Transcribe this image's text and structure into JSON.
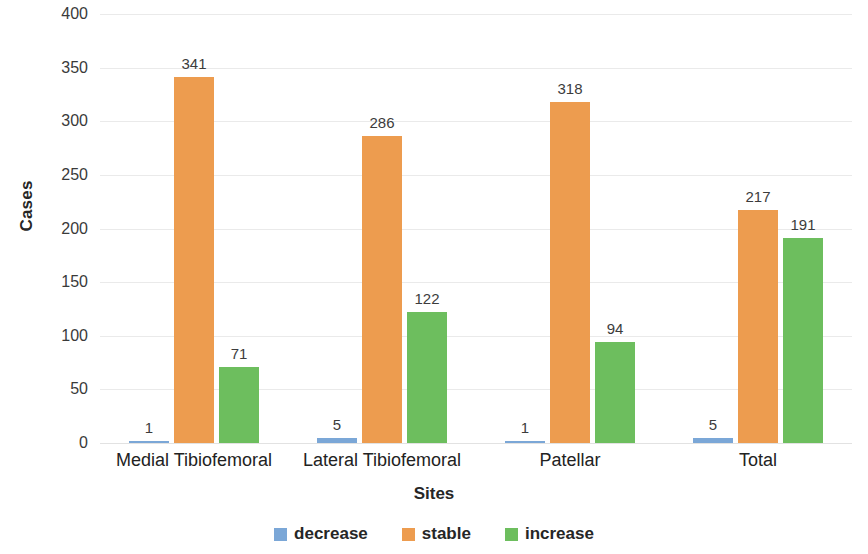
{
  "chart_data": {
    "type": "bar",
    "title": "",
    "xlabel": "Sites",
    "ylabel": "Cases",
    "categories": [
      "Medial Tibiofemoral",
      "Lateral Tibiofemoral",
      "Patellar",
      "Total"
    ],
    "series": [
      {
        "name": "decrease",
        "color": "#7BA7D7",
        "values": [
          1,
          5,
          1,
          5
        ]
      },
      {
        "name": "stable",
        "color": "#ED9C4F",
        "values": [
          341,
          286,
          318,
          217
        ]
      },
      {
        "name": "increase",
        "color": "#6DBE5E",
        "values": [
          71,
          122,
          94,
          191
        ]
      }
    ],
    "ylim": [
      0,
      400
    ],
    "yticks": [
      400,
      350,
      300,
      250,
      200,
      150,
      100,
      50,
      0
    ],
    "ytick_labels": [
      "400",
      "350",
      "300",
      "250",
      "200",
      "150",
      "100",
      "50",
      "0"
    ],
    "grid": true,
    "legend_position": "bottom",
    "data_labels": true
  },
  "legend": {
    "items": [
      {
        "label": "decrease",
        "color": "#7BA7D7"
      },
      {
        "label": "stable",
        "color": "#ED9C4F"
      },
      {
        "label": "increase",
        "color": "#6DBE5E"
      }
    ]
  }
}
